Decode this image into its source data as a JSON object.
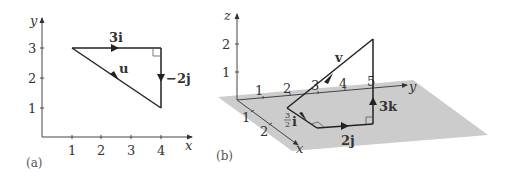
{
  "figure": {
    "panel_a": {
      "label": "(a)",
      "x_axis_label": "x",
      "y_axis_label": "y",
      "x_ticks": [
        "1",
        "2",
        "3",
        "4"
      ],
      "y_ticks": [
        "1",
        "2",
        "3"
      ],
      "vectors": {
        "horizontal": "3i",
        "vertical": "−2j",
        "resultant": "u"
      },
      "points": {
        "start": [
          1,
          3
        ],
        "corner": [
          4,
          3
        ],
        "end": [
          4,
          1
        ]
      }
    },
    "panel_b": {
      "label": "(b)",
      "x_axis_label": "x",
      "y_axis_label": "y",
      "z_axis_label": "z",
      "x_ticks": [
        "1",
        "2"
      ],
      "y_ticks": [
        "1",
        "2",
        "3",
        "4",
        "5"
      ],
      "z_ticks": [
        "1",
        "2"
      ],
      "vectors": {
        "first": "i",
        "first_coef_num": "3",
        "first_coef_den": "2",
        "second": "2j",
        "third": "3k",
        "resultant": "v"
      }
    },
    "colors": {
      "line": "#222222",
      "axis": "#444444",
      "plane": "#cccccc"
    }
  }
}
